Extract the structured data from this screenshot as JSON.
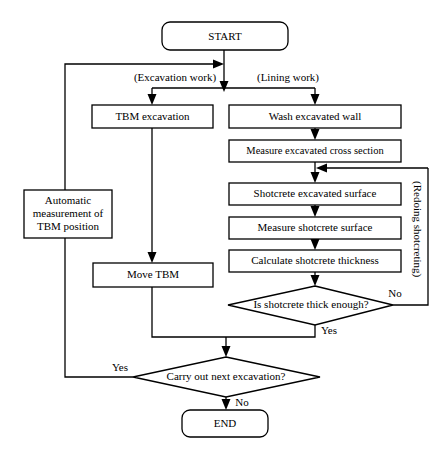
{
  "diagram": {
    "colors": {
      "stroke": "#000000",
      "fill": "#ffffff",
      "text": "#000000"
    },
    "nodes": {
      "start": {
        "label": "START",
        "shape": "terminator"
      },
      "tbm_excavation": {
        "label": "TBM excavation",
        "shape": "process"
      },
      "wash_excavated_wall": {
        "label": "Wash excavated wall",
        "shape": "process"
      },
      "measure_excavated_cross_section": {
        "label": "Measure excavated cross section",
        "shape": "process"
      },
      "automatic_measurement": {
        "line1": "Automatic",
        "line2": "measurement of",
        "line3": "TBM position",
        "shape": "process"
      },
      "shotcrete_excavated_surface": {
        "label": "Shotcrete excavated surface",
        "shape": "process"
      },
      "measure_shotcrete_surface": {
        "label": "Measure shotcrete surface",
        "shape": "process"
      },
      "calculate_shotcrete_thickness": {
        "label": "Calculate shotcrete thickness",
        "shape": "process"
      },
      "move_tbm": {
        "label": "Move TBM",
        "shape": "process"
      },
      "is_shotcrete_thick_enough": {
        "label": "Is shotcrete thick enough?",
        "shape": "decision"
      },
      "carry_out_next_excavation": {
        "label": "Carry out next excavation?",
        "shape": "decision"
      },
      "end": {
        "label": "END",
        "shape": "terminator"
      }
    },
    "edge_labels": {
      "excavation_work": "(Excavation work)",
      "lining_work": "(Lining work)",
      "redoing_shotcreting": "(Redoing shotcreting)",
      "shotcrete_no": "No",
      "shotcrete_yes": "Yes",
      "carry_yes": "Yes",
      "carry_no": "No"
    }
  }
}
